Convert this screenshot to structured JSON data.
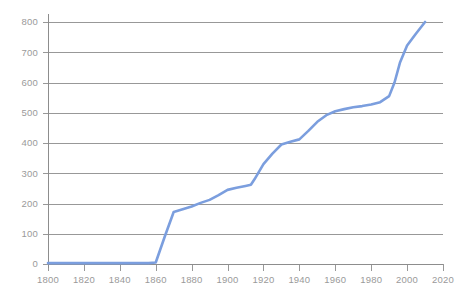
{
  "chart_data": {
    "type": "line",
    "title": "",
    "subtitle": "",
    "xlabel": "",
    "ylabel": "",
    "xlim": [
      1800,
      2020
    ],
    "ylim": [
      0,
      800
    ],
    "x_ticks": [
      1800,
      1820,
      1840,
      1860,
      1880,
      1900,
      1920,
      1940,
      1960,
      1980,
      2000,
      2020
    ],
    "y_ticks": [
      0,
      100,
      200,
      300,
      400,
      500,
      600,
      700,
      800
    ],
    "x_tick_labels": [
      "1800",
      "1820",
      "1840",
      "1860",
      "1880",
      "1900",
      "1920",
      "1940",
      "1960",
      "1980",
      "2000",
      "2020"
    ],
    "y_tick_labels": [
      "0",
      "100",
      "200",
      "300",
      "400",
      "500",
      "600",
      "700",
      "800"
    ],
    "grid": "horizontal",
    "legend": "none",
    "line_color": "#7b9ede",
    "grid_color": "#8d8d8d",
    "axis_color": "#8d8d8d",
    "label_color": "#9a9a9a",
    "background_color": "#ffffff",
    "series": [
      {
        "name": "series-1",
        "color": "#7b9ede",
        "x": [
          1800,
          1810,
          1820,
          1830,
          1840,
          1850,
          1856,
          1860,
          1865,
          1870,
          1875,
          1880,
          1885,
          1890,
          1895,
          1900,
          1905,
          1910,
          1913,
          1915,
          1920,
          1925,
          1930,
          1935,
          1940,
          1945,
          1950,
          1955,
          1960,
          1965,
          1970,
          1975,
          1980,
          1985,
          1990,
          1993,
          1996,
          2000,
          2005,
          2010
        ],
        "y": [
          3,
          3,
          3,
          3,
          3,
          3,
          3,
          5,
          90,
          172,
          181,
          190,
          202,
          212,
          228,
          245,
          252,
          258,
          262,
          280,
          330,
          365,
          395,
          404,
          412,
          440,
          470,
          492,
          505,
          512,
          518,
          522,
          527,
          535,
          555,
          600,
          665,
          722,
          762,
          800
        ]
      }
    ]
  },
  "axes": {
    "plot_left_px": 48,
    "plot_right_px": 443,
    "plot_top_px": 22,
    "plot_bottom_px": 264
  }
}
